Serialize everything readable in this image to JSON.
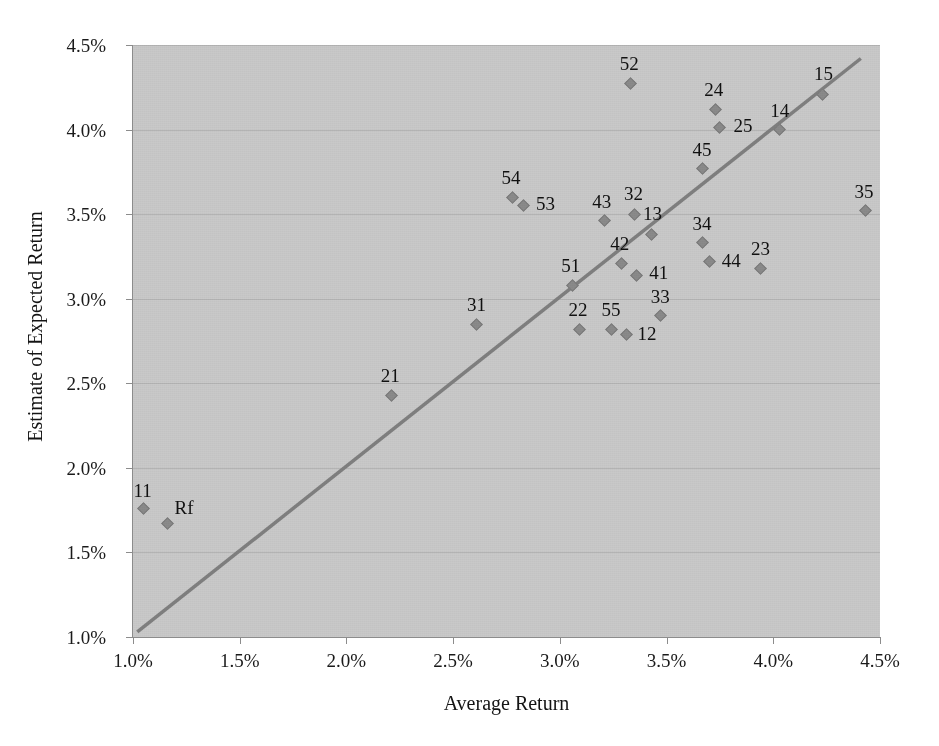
{
  "chart_data": {
    "type": "scatter",
    "title": "",
    "xlabel": "Average Return",
    "ylabel": "Estimate of Expected Return",
    "xlim": [
      1.0,
      4.5
    ],
    "ylim": [
      1.0,
      4.5
    ],
    "xticks": [
      "1.0%",
      "1.5%",
      "2.0%",
      "2.5%",
      "3.0%",
      "3.5%",
      "4.0%",
      "4.5%"
    ],
    "xtick_values": [
      1.0,
      1.5,
      2.0,
      2.5,
      3.0,
      3.5,
      4.0,
      4.5
    ],
    "yticks": [
      "1.0%",
      "1.5%",
      "2.0%",
      "2.5%",
      "3.0%",
      "3.5%",
      "4.0%",
      "4.5%"
    ],
    "ytick_values": [
      1.0,
      1.5,
      2.0,
      2.5,
      3.0,
      3.5,
      4.0,
      4.5
    ],
    "grid": "horizontal",
    "legend": "none",
    "plot_background": "#c9c9c9",
    "marker_color": "#8a8a8a",
    "trendline_color": "#7f7f7f",
    "gridline_color": "#b4b4b4",
    "axis_color": "#8c8c8c",
    "trendline": {
      "x0": 1.02,
      "y0": 1.03,
      "x1": 4.41,
      "y1": 4.42
    },
    "points": [
      {
        "label": "11",
        "x": 1.05,
        "y": 1.76,
        "label_dx": -1,
        "label_dy": -20
      },
      {
        "label": "Rf",
        "x": 1.16,
        "y": 1.67,
        "label_dx": 17,
        "label_dy": -18
      },
      {
        "label": "21",
        "x": 2.21,
        "y": 2.43,
        "label_dx": -1,
        "label_dy": -21
      },
      {
        "label": "31",
        "x": 2.61,
        "y": 2.85,
        "label_dx": 0,
        "label_dy": -21
      },
      {
        "label": "54",
        "x": 2.78,
        "y": 3.6,
        "label_dx": -2,
        "label_dy": -21
      },
      {
        "label": "53",
        "x": 2.83,
        "y": 3.55,
        "label_dx": 22,
        "label_dy": -4
      },
      {
        "label": "51",
        "x": 3.06,
        "y": 3.08,
        "label_dx": -2,
        "label_dy": -21
      },
      {
        "label": "22",
        "x": 3.09,
        "y": 2.82,
        "label_dx": -1,
        "label_dy": -21
      },
      {
        "label": "55",
        "x": 3.24,
        "y": 2.82,
        "label_dx": 0,
        "label_dy": -21
      },
      {
        "label": "43",
        "x": 3.21,
        "y": 3.46,
        "label_dx": -3,
        "label_dy": -21
      },
      {
        "label": "42",
        "x": 3.29,
        "y": 3.21,
        "label_dx": -2,
        "label_dy": -21
      },
      {
        "label": "12",
        "x": 3.31,
        "y": 2.79,
        "label_dx": 21,
        "label_dy": -2
      },
      {
        "label": "32",
        "x": 3.35,
        "y": 3.5,
        "label_dx": -1,
        "label_dy": -22
      },
      {
        "label": "52",
        "x": 3.33,
        "y": 4.27,
        "label_dx": -1,
        "label_dy": -22
      },
      {
        "label": "41",
        "x": 3.36,
        "y": 3.14,
        "label_dx": 22,
        "label_dy": -4
      },
      {
        "label": "33",
        "x": 3.47,
        "y": 2.9,
        "label_dx": 0,
        "label_dy": -21
      },
      {
        "label": "13",
        "x": 3.43,
        "y": 3.38,
        "label_dx": 1,
        "label_dy": -22
      },
      {
        "label": "45",
        "x": 3.67,
        "y": 3.77,
        "label_dx": -1,
        "label_dy": -21
      },
      {
        "label": "34",
        "x": 3.67,
        "y": 3.33,
        "label_dx": -1,
        "label_dy": -21
      },
      {
        "label": "44",
        "x": 3.7,
        "y": 3.22,
        "label_dx": 22,
        "label_dy": -3
      },
      {
        "label": "24",
        "x": 3.73,
        "y": 4.12,
        "label_dx": -2,
        "label_dy": -21
      },
      {
        "label": "25",
        "x": 3.75,
        "y": 4.01,
        "label_dx": 23,
        "label_dy": -4
      },
      {
        "label": "14",
        "x": 4.03,
        "y": 4.0,
        "label_dx": 0,
        "label_dy": -21
      },
      {
        "label": "23",
        "x": 3.94,
        "y": 3.18,
        "label_dx": 0,
        "label_dy": -21
      },
      {
        "label": "15",
        "x": 4.23,
        "y": 4.21,
        "label_dx": 1,
        "label_dy": -22
      },
      {
        "label": "35",
        "x": 4.43,
        "y": 3.52,
        "label_dx": -1,
        "label_dy": -21
      }
    ]
  }
}
